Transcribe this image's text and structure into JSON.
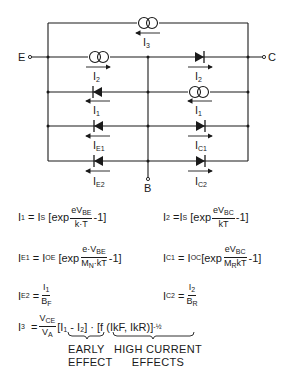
{
  "circuit": {
    "terminals": {
      "emitter": "E",
      "collector": "C",
      "base": "B"
    },
    "branches": [
      {
        "id": "top",
        "element": "current-source",
        "label": "I",
        "sub": "3",
        "direction": "left"
      },
      {
        "id": "ec-left",
        "element": "current-source",
        "label": "I",
        "sub": "2",
        "direction": "right"
      },
      {
        "id": "ec-right",
        "element": "diode",
        "label": "I",
        "sub": "2",
        "direction": "right"
      },
      {
        "id": "row2-left",
        "element": "diode",
        "label": "I",
        "sub": "1",
        "direction": "left"
      },
      {
        "id": "row2-right",
        "element": "current-source",
        "label": "I",
        "sub": "1",
        "direction": "left"
      },
      {
        "id": "row3-left",
        "element": "diode",
        "label": "I",
        "sub": "E1",
        "direction": "left"
      },
      {
        "id": "row3-right",
        "element": "diode",
        "label": "I",
        "sub": "C1",
        "direction": "right"
      },
      {
        "id": "row4-left",
        "element": "diode",
        "label": "I",
        "sub": "E2",
        "direction": "left"
      },
      {
        "id": "row4-right",
        "element": "diode",
        "label": "I",
        "sub": "C2",
        "direction": "right"
      }
    ]
  },
  "equations": {
    "i1": {
      "lhs": "I",
      "lhs_sub": "1",
      "eq": "=",
      "coef": "I",
      "coef_sub": "S",
      "open": "[exp",
      "num": "eV",
      "num_sub": "BE",
      "den": "k·T",
      "close": "-1]"
    },
    "i2": {
      "lhs": "I",
      "lhs_sub": "2",
      "eq": "=",
      "coef": "I",
      "coef_sub": "S",
      "open": "[exp",
      "num": "eV",
      "num_sub": "BC",
      "den": "kT",
      "close": "-1]"
    },
    "ie1": {
      "lhs": "I",
      "lhs_sub": "E1",
      "eq": "=",
      "coef": "I",
      "coef_sub": "OE",
      "open": "[exp",
      "num": "e·V",
      "num_sub": "BE",
      "den": "M",
      "den_sub": "N",
      "den_tail": "·kT",
      "close": "-1]"
    },
    "ic1": {
      "lhs": "I",
      "lhs_sub": "C1",
      "eq": "=",
      "coef": "I",
      "coef_sub": "OC",
      "open": "[exp",
      "num": "eV",
      "num_sub": "BC",
      "den": "M",
      "den_sub": "R",
      "den_tail": "kT",
      "close": "-1]"
    },
    "ie2": {
      "lhs": "I",
      "lhs_sub": "E2",
      "eq": "=",
      "num": "I",
      "num_sub": "1",
      "den": "B",
      "den_sub": "F"
    },
    "ic2": {
      "lhs": "I",
      "lhs_sub": "C2",
      "eq": "=",
      "num": "I",
      "num_sub": "2",
      "den": "B",
      "den_sub": "R"
    },
    "i3": {
      "lhs": "I",
      "lhs_sub": "3",
      "eq": "=",
      "num": "V",
      "num_sub": "CE",
      "den": "V",
      "den_sub": "A",
      "early_term": "[I₁ - I₂]",
      "dot": "·",
      "hc_term": "[f (IkF, IkR)]",
      "exponent": "-½"
    },
    "annotations": {
      "early_line1": "EARLY",
      "early_line2": "EFFECT",
      "hc_line1": "HIGH CURRENT",
      "hc_line2": "EFFECTS"
    }
  }
}
